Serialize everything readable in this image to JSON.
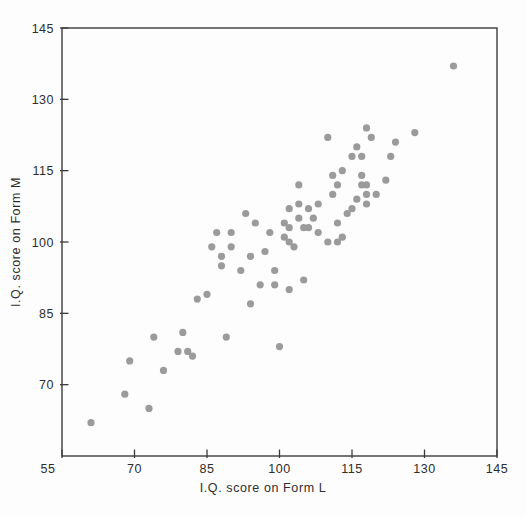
{
  "chart_data": {
    "type": "scatter",
    "title": "",
    "xlabel": "I.Q. score on Form L",
    "ylabel": "I.Q. score on Form M",
    "xlim": [
      55,
      145
    ],
    "ylim": [
      55,
      145
    ],
    "xticks": [
      55,
      70,
      85,
      100,
      115,
      130,
      145
    ],
    "yticks": [
      70,
      85,
      100,
      115,
      130,
      145
    ],
    "grid": false,
    "legend": false,
    "point_color": "#9b9b9b",
    "frame_color": "#3c3c3c",
    "background": "#fdfdfd",
    "points": [
      [
        61,
        62
      ],
      [
        68,
        68
      ],
      [
        73,
        65
      ],
      [
        69,
        75
      ],
      [
        74,
        80
      ],
      [
        76,
        73
      ],
      [
        79,
        77
      ],
      [
        81,
        77
      ],
      [
        82,
        76
      ],
      [
        80,
        81
      ],
      [
        89,
        80
      ],
      [
        83,
        88
      ],
      [
        85,
        89
      ],
      [
        94,
        87
      ],
      [
        88,
        95
      ],
      [
        87,
        102
      ],
      [
        90,
        102
      ],
      [
        86,
        99
      ],
      [
        88,
        97
      ],
      [
        90,
        99
      ],
      [
        92,
        94
      ],
      [
        94,
        97
      ],
      [
        93,
        106
      ],
      [
        95,
        104
      ],
      [
        101,
        104
      ],
      [
        104,
        105
      ],
      [
        105,
        103
      ],
      [
        106,
        103
      ],
      [
        102,
        103
      ],
      [
        98,
        102
      ],
      [
        101,
        101
      ],
      [
        102,
        100
      ],
      [
        103,
        99
      ],
      [
        97,
        98
      ],
      [
        99,
        94
      ],
      [
        105,
        92
      ],
      [
        102,
        107
      ],
      [
        104,
        108
      ],
      [
        106,
        107
      ],
      [
        108,
        108
      ],
      [
        107,
        105
      ],
      [
        96,
        91
      ],
      [
        99,
        91
      ],
      [
        102,
        90
      ],
      [
        100,
        78
      ],
      [
        104,
        112
      ],
      [
        111,
        114
      ],
      [
        113,
        115
      ],
      [
        112,
        112
      ],
      [
        117,
        114
      ],
      [
        115,
        118
      ],
      [
        117,
        118
      ],
      [
        123,
        118
      ],
      [
        122,
        113
      ],
      [
        116,
        120
      ],
      [
        124,
        121
      ],
      [
        110,
        122
      ],
      [
        118,
        124
      ],
      [
        119,
        122
      ],
      [
        128,
        123
      ],
      [
        136,
        137
      ],
      [
        111,
        110
      ],
      [
        114,
        106
      ],
      [
        112,
        104
      ],
      [
        108,
        102
      ],
      [
        110,
        100
      ],
      [
        112,
        100
      ],
      [
        113,
        101
      ],
      [
        115,
        107
      ],
      [
        116,
        109
      ],
      [
        118,
        108
      ],
      [
        118,
        110
      ],
      [
        120,
        110
      ],
      [
        117,
        112
      ],
      [
        118,
        112
      ]
    ]
  }
}
